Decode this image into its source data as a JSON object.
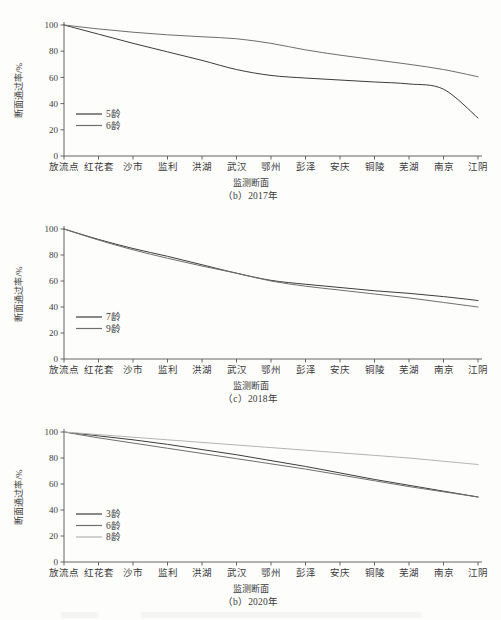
{
  "figure": {
    "y_axis_title": "断面通过率/%",
    "x_axis_title": "监测断面",
    "y_ticks": [
      "0",
      "20",
      "40",
      "60",
      "80",
      "100"
    ],
    "categories": [
      "放流点",
      "红花套",
      "沙市",
      "监利",
      "洪湖",
      "武汉",
      "鄂州",
      "彭泽",
      "安庆",
      "铜陵",
      "芜湖",
      "南京",
      "江阴"
    ],
    "line_color_dark": "#3c3c3c",
    "line_color_mid": "#6e6e6e",
    "line_color_light": "#b4b4b4"
  },
  "chart_data": [
    {
      "type": "line",
      "title": "（b）2017年",
      "xlabel": "监测断面",
      "ylabel": "断面通过率/%",
      "ylim": [
        0,
        100
      ],
      "grid": false,
      "legend_position": "lower-left",
      "categories": [
        "放流点",
        "红花套",
        "沙市",
        "监利",
        "洪湖",
        "武汉",
        "鄂州",
        "彭泽",
        "安庆",
        "铜陵",
        "芜湖",
        "南京",
        "江阴"
      ],
      "series": [
        {
          "name": "5龄",
          "color": "#3c3c3c",
          "values": [
            100,
            93,
            86,
            79.5,
            73,
            66,
            61.5,
            59.5,
            58,
            56.5,
            55,
            51,
            29
          ]
        },
        {
          "name": "6龄",
          "color": "#6e6e6e",
          "values": [
            100,
            97,
            94.5,
            92.5,
            91,
            89.5,
            86,
            81,
            77,
            73.5,
            70,
            66,
            60.5
          ]
        }
      ]
    },
    {
      "type": "line",
      "title": "（c）2018年",
      "xlabel": "监测断面",
      "ylabel": "断面通过率/%",
      "ylim": [
        0,
        100
      ],
      "grid": false,
      "legend_position": "lower-left",
      "categories": [
        "放流点",
        "红花套",
        "沙市",
        "监利",
        "洪湖",
        "武汉",
        "鄂州",
        "彭泽",
        "安庆",
        "铜陵",
        "芜湖",
        "南京",
        "江阴"
      ],
      "series": [
        {
          "name": "7龄",
          "color": "#3c3c3c",
          "values": [
            100,
            92,
            85,
            79,
            72.5,
            66,
            60.5,
            57.5,
            55,
            52.5,
            50.5,
            48,
            45
          ]
        },
        {
          "name": "9龄",
          "color": "#6e6e6e",
          "values": [
            100,
            91.5,
            84,
            77.5,
            71.5,
            66,
            60,
            56,
            53,
            50,
            47,
            43.5,
            40
          ]
        }
      ]
    },
    {
      "type": "line",
      "title": "（b）2020年",
      "xlabel": "监测断面",
      "ylabel": "断面通过率/%",
      "ylim": [
        0,
        100
      ],
      "grid": false,
      "legend_position": "lower-left",
      "categories": [
        "放流点",
        "红花套",
        "沙市",
        "监利",
        "洪湖",
        "武汉",
        "鄂州",
        "彭泽",
        "安庆",
        "铜陵",
        "芜湖",
        "南京",
        "江阴"
      ],
      "series": [
        {
          "name": "3龄",
          "color": "#3c3c3c",
          "values": [
            100,
            97,
            94,
            90.5,
            86.5,
            82.5,
            78,
            73.5,
            68.5,
            63.5,
            59,
            54.5,
            50
          ]
        },
        {
          "name": "6龄",
          "color": "#6e6e6e",
          "values": [
            100,
            95.5,
            91.5,
            87.5,
            83.5,
            79.5,
            75.5,
            71.5,
            67,
            62.5,
            58,
            54,
            50
          ]
        },
        {
          "name": "8龄",
          "color": "#b4b4b4",
          "values": [
            100,
            98,
            96,
            94,
            92,
            90,
            88,
            86,
            84,
            82,
            80,
            77.5,
            75
          ]
        }
      ]
    }
  ]
}
